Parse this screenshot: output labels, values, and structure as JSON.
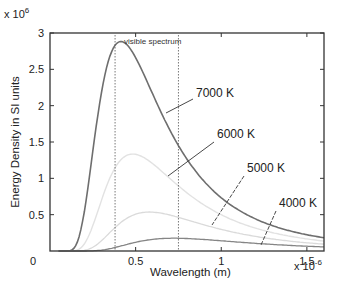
{
  "chart_data": {
    "type": "line",
    "title": "",
    "xlabel": "Wavelength  (m)",
    "ylabel": "Energy Density in SI units",
    "x_multiplier": "x 10",
    "x_multiplier_exp": "-6",
    "y_multiplier": "x 10",
    "y_multiplier_exp": "6",
    "xlim": [
      0,
      1.6
    ],
    "ylim": [
      0,
      3
    ],
    "x_ticks": [
      0,
      0.5,
      1,
      1.5
    ],
    "x_tick_labels": [
      "0",
      "0.5",
      "1",
      "1.5"
    ],
    "y_ticks": [
      0.5,
      1,
      1.5,
      2,
      2.5,
      3
    ],
    "y_tick_labels": [
      "0.5",
      "1",
      "1.5",
      "2",
      "2.5",
      "3"
    ],
    "origin_label": "0",
    "grid": false,
    "legend": "none (inline annotations)",
    "visible_spectrum": {
      "label": "visible spectrum",
      "x_start": 0.38,
      "x_end": 0.75
    },
    "x_units_note": "wavelength in micrometers (x 10^-6 m)",
    "y_units_note": "energy density in units of 10^6",
    "series": [
      {
        "name": "7000 K",
        "temperature": 7000,
        "color": "#6e6e6e",
        "width": 1.6,
        "label_pos": [
          196,
          97
        ],
        "pointer": [
          [
            193,
            99
          ],
          [
            166,
            113
          ]
        ],
        "x": [
          0.1,
          0.2,
          0.3,
          0.4,
          0.5,
          0.6,
          0.8,
          1.0,
          1.2,
          1.55
        ],
        "values": [
          0.0,
          0.54,
          2.18,
          2.87,
          2.66,
          2.15,
          1.26,
          0.73,
          0.44,
          0.2
        ]
      },
      {
        "name": "6000 K",
        "temperature": 6000,
        "color": "#e2e2e2",
        "width": 1.4,
        "label_pos": [
          217,
          138
        ],
        "pointer": [
          [
            214,
            142
          ],
          [
            168,
            176
          ]
        ],
        "x": [
          0.2,
          0.3,
          0.4,
          0.5,
          0.6,
          0.8,
          1.0,
          1.2,
          1.55
        ],
        "values": [
          0.13,
          0.85,
          1.4,
          1.47,
          1.3,
          0.88,
          0.56,
          0.36,
          0.18
        ]
      },
      {
        "name": "5000 K",
        "temperature": 5000,
        "color": "#dadada",
        "width": 1.3,
        "label_pos": [
          247,
          172
        ],
        "pointer": [
          [
            244,
            176
          ],
          [
            212,
            225
          ]
        ],
        "x": [
          0.3,
          0.4,
          0.5,
          0.6,
          0.8,
          1.0,
          1.2,
          1.55
        ],
        "values": [
          0.23,
          0.54,
          0.71,
          0.72,
          0.57,
          0.4,
          0.28,
          0.15
        ]
      },
      {
        "name": "4000 K",
        "temperature": 4000,
        "color": "#858585",
        "width": 1.3,
        "label_pos": [
          279,
          207
        ],
        "pointer": [
          [
            276,
            211
          ],
          [
            261,
            245
          ]
        ],
        "x": [
          0.3,
          0.4,
          0.5,
          0.6,
          0.75,
          1.0,
          1.2,
          1.55
        ],
        "values": [
          0.02,
          0.1,
          0.18,
          0.22,
          0.24,
          0.2,
          0.16,
          0.1
        ]
      }
    ]
  },
  "colors": {
    "axis": "#333333",
    "text": "#222222",
    "spectrum_line": "#555555"
  }
}
